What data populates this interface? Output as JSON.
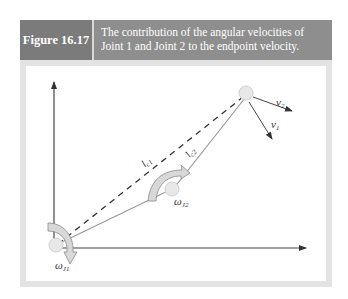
{
  "figure": {
    "number": "Figure 16.17",
    "caption_line1": "The contribution of the angular velocities of",
    "caption_line2": "Joint 1 and Joint 2 to the endpoint velocity."
  },
  "diagram": {
    "labels": {
      "omega_j1": "ω",
      "omega_j1_sub": "J1",
      "omega_j2": "ω",
      "omega_j2_sub": "J2",
      "l_c1": "l",
      "l_c1_sub": "c1",
      "l_c2": "l",
      "l_c2_sub": "c2",
      "v1": "v",
      "v1_sub": "1",
      "v2": "v",
      "v2_sub": "2"
    },
    "colors": {
      "header_bg": "#8e8e8e",
      "label_bg": "#7b7b7b",
      "frame": "#e3e3e3",
      "joint_fill": "#e6e6e6",
      "arrow_fill": "#d8d8d8"
    }
  }
}
